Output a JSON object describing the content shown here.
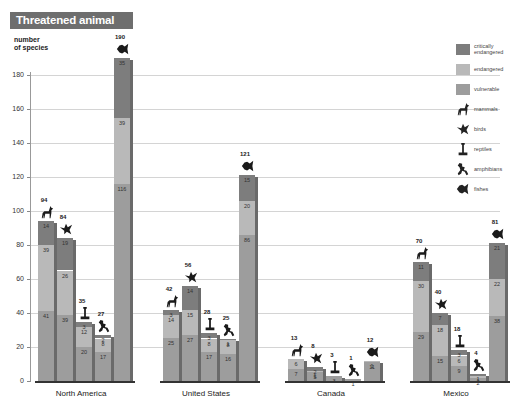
{
  "title": "Threatened animal species",
  "y_axis": {
    "label_line1": "number",
    "label_line2": "of species",
    "ticks": [
      "0",
      "20",
      "40",
      "60",
      "80",
      "100",
      "120",
      "140",
      "160",
      "180"
    ]
  },
  "legend": {
    "critically_endangered": "critically endangered",
    "endangered": "endangered",
    "vulnerable": "vulnerable",
    "mammals": "mammals",
    "birds": "birds",
    "reptiles": "reptiles",
    "amphibians": "amphibians",
    "fishes": "fishes"
  },
  "colors": {
    "critically_endangered": "#7d7d7d",
    "endangered": "#b9b9b9",
    "vulnerable": "#9d9d9d",
    "side": "#6a6a6a",
    "title_bg": "#6e6e6e"
  },
  "chart_data": {
    "type": "bar",
    "stacked": true,
    "title": "Threatened animal species",
    "xlabel": "",
    "ylabel": "number of species",
    "ylim": [
      0,
      180
    ],
    "grid": true,
    "legend_position": "right",
    "categories": [
      "North America",
      "United States",
      "Canada",
      "Mexico"
    ],
    "subcategories": [
      "mammals",
      "birds",
      "reptiles",
      "amphibians",
      "fishes"
    ],
    "stack_order": [
      "vulnerable",
      "endangered",
      "critically endangered"
    ],
    "groups": [
      {
        "name": "North America",
        "bars": [
          {
            "animal": "mammals",
            "total": 94,
            "critically_endangered": 14,
            "endangered": 39,
            "vulnerable": 41
          },
          {
            "animal": "birds",
            "total": 84,
            "critically_endangered": 19,
            "endangered": 26,
            "vulnerable": 39
          },
          {
            "animal": "reptiles",
            "total": 35,
            "critically_endangered": 3,
            "endangered": 12,
            "vulnerable": 20
          },
          {
            "animal": "amphibians",
            "total": 27,
            "critically_endangered": 2,
            "endangered": 8,
            "vulnerable": 17
          },
          {
            "animal": "fishes",
            "total": 190,
            "critically_endangered": 35,
            "endangered": 39,
            "vulnerable": 116
          }
        ]
      },
      {
        "name": "United States",
        "bars": [
          {
            "animal": "mammals",
            "total": 42,
            "critically_endangered": 3,
            "endangered": 14,
            "vulnerable": 25
          },
          {
            "animal": "birds",
            "total": 56,
            "critically_endangered": 14,
            "endangered": 15,
            "vulnerable": 27
          },
          {
            "animal": "reptiles",
            "total": 28,
            "critically_endangered": 3,
            "endangered": 8,
            "vulnerable": 17
          },
          {
            "animal": "amphibians",
            "total": 25,
            "critically_endangered": 1,
            "endangered": 8,
            "vulnerable": 16
          },
          {
            "animal": "fishes",
            "total": 121,
            "critically_endangered": 15,
            "endangered": 20,
            "vulnerable": 86
          }
        ]
      },
      {
        "name": "Canada",
        "bars": [
          {
            "animal": "mammals",
            "total": 13,
            "critically_endangered": 0,
            "endangered": 6,
            "vulnerable": 7
          },
          {
            "animal": "birds",
            "total": 8,
            "critically_endangered": 2,
            "endangered": 1,
            "vulnerable": 5
          },
          {
            "animal": "reptiles",
            "total": 3,
            "critically_endangered": 0,
            "endangered": 0,
            "vulnerable": 3
          },
          {
            "animal": "amphibians",
            "total": 1,
            "critically_endangered": 0,
            "endangered": 0,
            "vulnerable": 1
          },
          {
            "animal": "fishes",
            "total": 12,
            "critically_endangered": 0,
            "endangered": 1,
            "vulnerable": 11
          }
        ]
      },
      {
        "name": "Mexico",
        "bars": [
          {
            "animal": "mammals",
            "total": 70,
            "critically_endangered": 11,
            "endangered": 30,
            "vulnerable": 29
          },
          {
            "animal": "birds",
            "total": 40,
            "critically_endangered": 7,
            "endangered": 18,
            "vulnerable": 15
          },
          {
            "animal": "reptiles",
            "total": 18,
            "critically_endangered": 3,
            "endangered": 6,
            "vulnerable": 9
          },
          {
            "animal": "amphibians",
            "total": 4,
            "critically_endangered": 1,
            "endangered": 1,
            "vulnerable": 2
          },
          {
            "animal": "fishes",
            "total": 81,
            "critically_endangered": 21,
            "endangered": 22,
            "vulnerable": 38
          }
        ]
      }
    ]
  }
}
